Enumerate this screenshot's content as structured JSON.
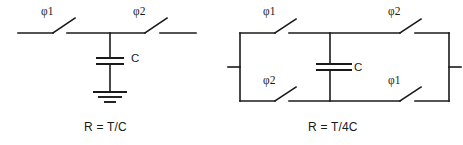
{
  "figure": {
    "background_color": "#ffffff",
    "line_color": "#1a1a1a"
  },
  "circuits": [
    {
      "id": "series-switched-capacitor",
      "caption": "R = T/C",
      "capacitor_label": "C",
      "switches": [
        {
          "id": "left-switch",
          "phase_label": "φ1"
        },
        {
          "id": "right-switch",
          "phase_label": "φ2"
        }
      ],
      "ground": "ground-symbol"
    },
    {
      "id": "parallel-switched-capacitor",
      "caption": "R = T/4C",
      "capacitor_label": "C",
      "switches": [
        {
          "id": "top-left-switch",
          "phase_label": "φ1"
        },
        {
          "id": "top-right-switch",
          "phase_label": "φ2"
        },
        {
          "id": "bottom-left-switch",
          "phase_label": "φ2"
        },
        {
          "id": "bottom-right-switch",
          "phase_label": "φ1"
        }
      ]
    }
  ]
}
